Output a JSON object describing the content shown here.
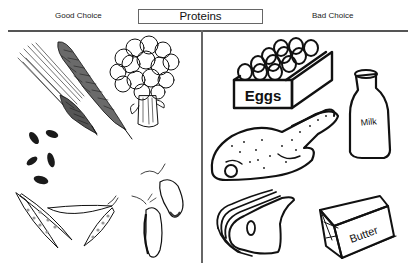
{
  "header": {
    "title": "Proteins",
    "left_column_label": "Good Choice",
    "right_column_label": "Bad Choice"
  },
  "good_choices": [
    {
      "name": "barley",
      "icon": "barley-icon"
    },
    {
      "name": "wheat",
      "icon": "wheat-icon"
    },
    {
      "name": "broccoli",
      "icon": "broccoli-icon"
    },
    {
      "name": "seeds",
      "icon": "seeds-icon"
    },
    {
      "name": "pea pods",
      "icon": "pea-pods-icon"
    },
    {
      "name": "beans",
      "icon": "beans-icon"
    }
  ],
  "bad_choices": [
    {
      "name": "eggs",
      "icon": "egg-carton-icon",
      "label": "Eggs"
    },
    {
      "name": "milk",
      "icon": "milk-bottle-icon",
      "label": "Milk"
    },
    {
      "name": "chicken",
      "icon": "chicken-icon"
    },
    {
      "name": "meat slices",
      "icon": "meat-slices-icon"
    },
    {
      "name": "butter",
      "icon": "butter-icon",
      "label": "Butter"
    }
  ]
}
